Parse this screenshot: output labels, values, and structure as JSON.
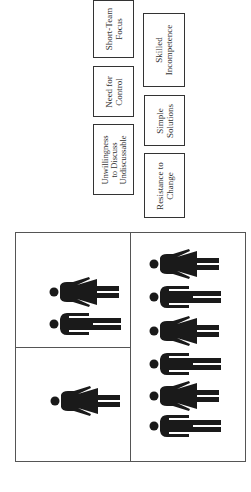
{
  "boxes": [
    {
      "id": "short-team-focus",
      "lines": [
        "Short-Team",
        "Focus"
      ]
    },
    {
      "id": "need-for-control",
      "lines": [
        "Need for",
        "Control"
      ]
    },
    {
      "id": "unwillingness",
      "lines": [
        "Unwillingness",
        "to Discuss",
        "Undiscussable"
      ]
    },
    {
      "id": "skilled-incompetence",
      "lines": [
        "Skilled",
        "Incompetence"
      ]
    },
    {
      "id": "simple-solutions",
      "lines": [
        "Simple",
        "Solutions"
      ]
    },
    {
      "id": "resistance-to-change",
      "lines": [
        "Resistance to",
        "Change"
      ]
    }
  ],
  "grid": {
    "top_left_cell": [
      "female",
      "male"
    ],
    "bottom_left_cell": [
      "female"
    ],
    "right_cell": [
      "female",
      "male",
      "female",
      "male",
      "female",
      "male"
    ]
  },
  "colors": {
    "figure": "#1a1a1a",
    "border": "#333333",
    "background": "#ffffff"
  }
}
